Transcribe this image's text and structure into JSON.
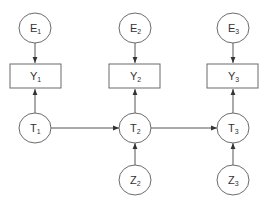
{
  "diagram": {
    "type": "directed-graph",
    "colors": {
      "stroke": "#6b6b6b",
      "edge": "#555555",
      "text": "#333333",
      "background": "#ffffff"
    },
    "nodes": [
      {
        "id": "E1",
        "base": "E",
        "sub": "1",
        "shape": "ellipse",
        "cx": 35,
        "cy": 28
      },
      {
        "id": "E2",
        "base": "E",
        "sub": "2",
        "shape": "ellipse",
        "cx": 135,
        "cy": 28
      },
      {
        "id": "E3",
        "base": "E",
        "sub": "3",
        "shape": "ellipse",
        "cx": 233,
        "cy": 28
      },
      {
        "id": "Y1",
        "base": "Y",
        "sub": "1",
        "shape": "rect",
        "cx": 35,
        "cy": 76
      },
      {
        "id": "Y2",
        "base": "Y",
        "sub": "2",
        "shape": "rect",
        "cx": 135,
        "cy": 76
      },
      {
        "id": "Y3",
        "base": "Y",
        "sub": "3",
        "shape": "rect",
        "cx": 233,
        "cy": 76
      },
      {
        "id": "T1",
        "base": "T",
        "sub": "1",
        "shape": "ellipse",
        "cx": 35,
        "cy": 128
      },
      {
        "id": "T2",
        "base": "T",
        "sub": "2",
        "shape": "ellipse",
        "cx": 135,
        "cy": 128
      },
      {
        "id": "T3",
        "base": "T",
        "sub": "3",
        "shape": "ellipse",
        "cx": 233,
        "cy": 128
      },
      {
        "id": "Z2",
        "base": "Z",
        "sub": "2",
        "shape": "ellipse",
        "cx": 135,
        "cy": 180
      },
      {
        "id": "Z3",
        "base": "Z",
        "sub": "3",
        "shape": "ellipse",
        "cx": 233,
        "cy": 180
      }
    ],
    "edges": [
      {
        "from": "E1",
        "to": "Y1"
      },
      {
        "from": "E2",
        "to": "Y2"
      },
      {
        "from": "E3",
        "to": "Y3"
      },
      {
        "from": "T1",
        "to": "Y1"
      },
      {
        "from": "T2",
        "to": "Y2"
      },
      {
        "from": "T3",
        "to": "Y3"
      },
      {
        "from": "T1",
        "to": "T2"
      },
      {
        "from": "T2",
        "to": "T3"
      },
      {
        "from": "Z2",
        "to": "T2"
      },
      {
        "from": "Z3",
        "to": "T3"
      }
    ],
    "labels": {
      "E1": {
        "base": "E",
        "sub": "1"
      },
      "E2": {
        "base": "E",
        "sub": "2"
      },
      "E3": {
        "base": "E",
        "sub": "3"
      },
      "Y1": {
        "base": "Y",
        "sub": "1"
      },
      "Y2": {
        "base": "Y",
        "sub": "2"
      },
      "Y3": {
        "base": "Y",
        "sub": "3"
      },
      "T1": {
        "base": "T",
        "sub": "1"
      },
      "T2": {
        "base": "T",
        "sub": "2"
      },
      "T3": {
        "base": "T",
        "sub": "3"
      },
      "Z2": {
        "base": "Z",
        "sub": "2"
      },
      "Z3": {
        "base": "Z",
        "sub": "3"
      }
    }
  }
}
